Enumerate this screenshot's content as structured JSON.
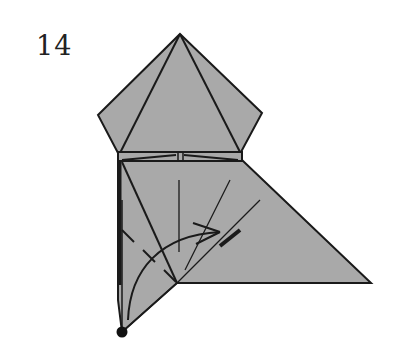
{
  "diagram": {
    "step_number": "14",
    "paper_color": "#a9a9a9",
    "line_color": "#1a1a1a",
    "elements": [
      "pentagon-head",
      "folded-band",
      "lower-body",
      "valley-fold-dashed-line",
      "curved-fold-arrow",
      "reference-dot"
    ]
  }
}
